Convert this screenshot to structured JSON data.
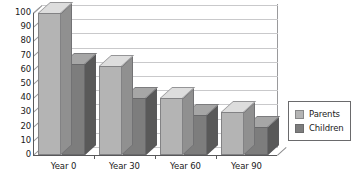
{
  "chart_data": {
    "type": "bar",
    "title": "",
    "subtitle": "",
    "xlabel": "",
    "ylabel": "",
    "categories": [
      "Year 0",
      "Year 30",
      "Year 60",
      "Year 90"
    ],
    "series": [
      {
        "name": "Parents",
        "values": [
          100,
          63,
          40,
          30
        ],
        "color": "#b4b4b4"
      },
      {
        "name": "Children",
        "values": [
          64,
          40,
          28,
          20
        ],
        "color": "#7d7d7d"
      }
    ],
    "ylim": [
      0,
      100
    ],
    "yticks": [
      0,
      10,
      20,
      30,
      40,
      50,
      60,
      70,
      80,
      90,
      100
    ],
    "ytick_labels": [
      "0",
      "10",
      "20",
      "30",
      "40",
      "50",
      "60",
      "70",
      "80",
      "90",
      "100"
    ],
    "grid": true,
    "grid_axis": "y",
    "legend_position": "right",
    "projection": "3d",
    "annotations": []
  },
  "legend": {
    "entries": [
      {
        "label": "Parents",
        "color": "#b4b4b4"
      },
      {
        "label": "Children",
        "color": "#7d7d7d"
      }
    ]
  },
  "colors": {
    "series_parents": "#b4b4b4",
    "series_children": "#7d7d7d",
    "axis": "#58585a",
    "grid": "#c9c9cb",
    "text": "#1a1a1a",
    "background": "#ffffff"
  }
}
